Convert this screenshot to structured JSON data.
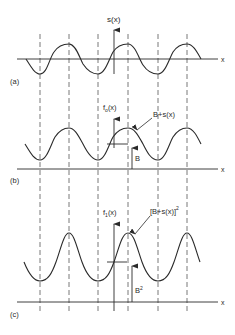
{
  "figure": {
    "panels": [
      {
        "id": "a",
        "panel_label": "(a)",
        "axis_label": "x",
        "function_label": "s(x)",
        "curve_label": "",
        "offset_label": ""
      },
      {
        "id": "b",
        "panel_label": "(b)",
        "axis_label": "x",
        "function_label": "f",
        "function_sub": "o",
        "function_suffix": "(x)",
        "curve_label": "B+s(x)",
        "offset_label": "B"
      },
      {
        "id": "c",
        "panel_label": "(c)",
        "axis_label": "x",
        "function_label": "f",
        "function_sub": "1",
        "function_suffix": "(x)",
        "curve_label": "[B+s(x)]",
        "curve_label_exp": "2",
        "offset_label": "B",
        "offset_label_exp": "2"
      }
    ],
    "colors": {
      "ink": "#2a2a2a",
      "dash": "#555555",
      "background": "#ffffff"
    }
  }
}
